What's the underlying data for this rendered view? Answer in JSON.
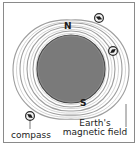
{
  "figure": {
    "background_color": "#ffffff",
    "border_color": "#8a8a8a"
  },
  "diagram": {
    "earth": {
      "name": "Earth",
      "fill_color": "#7a7a7a",
      "stroke_color": "#3a3a3a",
      "center_x": 71,
      "center_y": 69,
      "radius": 34
    },
    "poles": {
      "north_label": "N",
      "south_label": "S"
    },
    "field_lines": {
      "count": 8,
      "color": "#9a9a9a",
      "description": "nested dipole loops around Earth"
    },
    "compasses": [
      {
        "name": "compass-top-right",
        "x": 99,
        "y": 18,
        "needle_angle": 20
      },
      {
        "name": "compass-right",
        "x": 113,
        "y": 51,
        "needle_angle": -30
      },
      {
        "name": "compass-bottom-left",
        "x": 30,
        "y": 116,
        "needle_angle": 35
      }
    ]
  },
  "labels": {
    "north": "N",
    "south": "S",
    "compass": "compass",
    "earth_line1": "Earth's",
    "earth_line2": "magnetic field"
  }
}
